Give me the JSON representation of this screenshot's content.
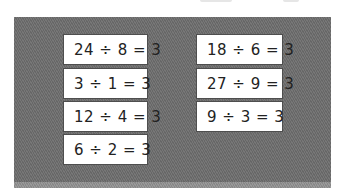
{
  "colors": {
    "panel": "#6d6d6d",
    "panel_base": "#8f8f8f",
    "card": "#ffffff",
    "text": "#222222"
  },
  "cards": {
    "left": [
      {
        "equation": "24 ÷ 8 = 3"
      },
      {
        "equation": "3 ÷ 1 = 3"
      },
      {
        "equation": "12 ÷ 4 = 3"
      },
      {
        "equation": "6 ÷ 2 = 3"
      }
    ],
    "right": [
      {
        "equation": "18 ÷ 6 = 3"
      },
      {
        "equation": "27 ÷ 9 = 3"
      },
      {
        "equation": "9 ÷ 3 = 3"
      }
    ]
  }
}
